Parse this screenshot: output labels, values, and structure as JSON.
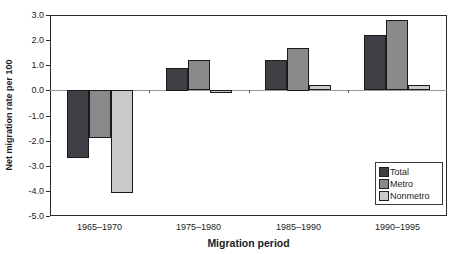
{
  "chart_data": {
    "type": "bar",
    "title": "",
    "xlabel": "Migration period",
    "ylabel": "Net migration rate per 100",
    "categories": [
      "1965–1970",
      "1975–1980",
      "1985–1990",
      "1990–1995"
    ],
    "series": [
      {
        "name": "Total",
        "color": "#3f3f46",
        "values": [
          -2.7,
          0.9,
          1.2,
          2.2
        ]
      },
      {
        "name": "Metro",
        "color": "#8a8a8c",
        "values": [
          -1.9,
          1.2,
          1.7,
          2.8
        ]
      },
      {
        "name": "Nonmetro",
        "color": "#c9c9c9",
        "values": [
          -4.1,
          -0.1,
          0.2,
          0.2
        ]
      }
    ],
    "ylim": [
      -5.0,
      3.0
    ],
    "ytick_step": 1.0,
    "ytick_labels": [
      "3.0",
      "2.0",
      "1.0",
      "0.0",
      "-1.0",
      "-2.0",
      "-3.0",
      "-4.0",
      "-5.0"
    ],
    "grid": false,
    "legend_position": "inside-bottom-right",
    "axis_color": "#2b2b2b",
    "zero_line_color": "#9a9a9a",
    "bar_border_color": "#1a1a1a",
    "text_color": "#1c1c1c"
  }
}
